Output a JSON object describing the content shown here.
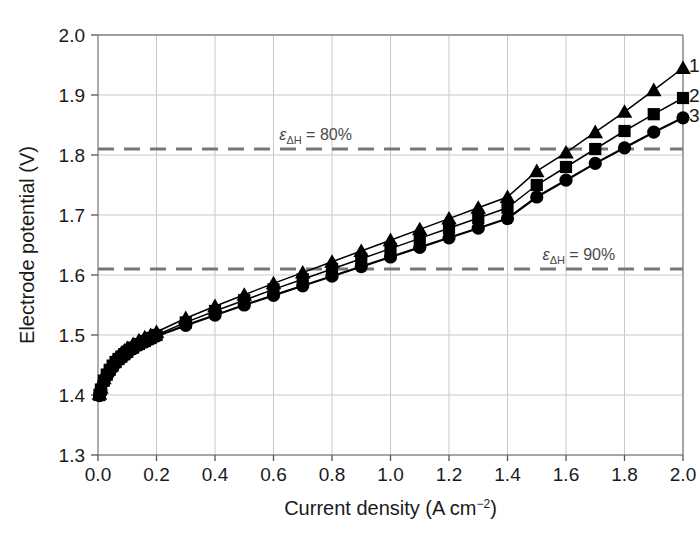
{
  "chart_data": {
    "type": "line",
    "title": "",
    "xlabel": "Current density (A cm−2)",
    "xlabel_base": "Current density (A cm",
    "xlabel_sup": "−2",
    "xlabel_tail": ")",
    "ylabel": "Electrode potential (V)",
    "xlim": [
      0.0,
      2.0
    ],
    "ylim": [
      1.3,
      2.0
    ],
    "xticks": [
      "0.0",
      "0.2",
      "0.4",
      "0.6",
      "0.8",
      "1.0",
      "1.2",
      "1.4",
      "1.6",
      "1.8",
      "2.0"
    ],
    "xtick_values": [
      0.0,
      0.2,
      0.4,
      0.6,
      0.8,
      1.0,
      1.2,
      1.4,
      1.6,
      1.8,
      2.0
    ],
    "yticks": [
      "1.3",
      "1.4",
      "1.5",
      "1.6",
      "1.7",
      "1.8",
      "1.9",
      "2.0"
    ],
    "ytick_values": [
      1.3,
      1.4,
      1.5,
      1.6,
      1.7,
      1.8,
      1.9,
      2.0
    ],
    "grid": true,
    "grid_color": "#c9c9c9",
    "legend_position": "right-inline",
    "line_color": "#000000",
    "marker_color": "#000000",
    "annotations": [
      {
        "name": "efficiency-80-line",
        "symbol": "ε",
        "subscript": "ΔH",
        "equals": " = ",
        "value": "80%",
        "text": "εΔH = 80%",
        "y": 1.81,
        "style": "dashed",
        "color": "#777777",
        "label_x": 0.62
      },
      {
        "name": "efficiency-90-line",
        "symbol": "ε",
        "subscript": "ΔH",
        "equals": " = ",
        "value": "90%",
        "text": "εΔH = 90%",
        "y": 1.61,
        "style": "dashed",
        "color": "#777777",
        "label_x": 1.52
      }
    ],
    "series": [
      {
        "name": "1",
        "label": "1",
        "marker": "triangle",
        "x": [
          0.005,
          0.01,
          0.02,
          0.03,
          0.04,
          0.05,
          0.06,
          0.07,
          0.08,
          0.09,
          0.1,
          0.12,
          0.14,
          0.16,
          0.18,
          0.2,
          0.3,
          0.4,
          0.5,
          0.6,
          0.7,
          0.8,
          0.9,
          1.0,
          1.1,
          1.2,
          1.3,
          1.4,
          1.5,
          1.6,
          1.7,
          1.8,
          1.9,
          2.0
        ],
        "values": [
          1.402,
          1.412,
          1.428,
          1.439,
          1.447,
          1.454,
          1.46,
          1.465,
          1.47,
          1.474,
          1.478,
          1.485,
          1.491,
          1.496,
          1.5,
          1.505,
          1.528,
          1.548,
          1.567,
          1.586,
          1.604,
          1.622,
          1.64,
          1.658,
          1.676,
          1.694,
          1.712,
          1.73,
          1.773,
          1.804,
          1.838,
          1.872,
          1.908,
          1.945
        ]
      },
      {
        "name": "2",
        "label": "2",
        "marker": "square",
        "x": [
          0.005,
          0.01,
          0.02,
          0.03,
          0.04,
          0.05,
          0.06,
          0.07,
          0.08,
          0.09,
          0.1,
          0.12,
          0.14,
          0.16,
          0.18,
          0.2,
          0.3,
          0.4,
          0.5,
          0.6,
          0.7,
          0.8,
          0.9,
          1.0,
          1.1,
          1.2,
          1.3,
          1.4,
          1.5,
          1.6,
          1.7,
          1.8,
          1.9,
          2.0
        ],
        "values": [
          1.4,
          1.409,
          1.424,
          1.434,
          1.442,
          1.449,
          1.455,
          1.46,
          1.464,
          1.468,
          1.472,
          1.479,
          1.485,
          1.49,
          1.495,
          1.5,
          1.521,
          1.54,
          1.558,
          1.576,
          1.593,
          1.61,
          1.627,
          1.644,
          1.661,
          1.678,
          1.695,
          1.712,
          1.75,
          1.78,
          1.81,
          1.84,
          1.868,
          1.895
        ]
      },
      {
        "name": "3",
        "label": "3",
        "marker": "circle",
        "x": [
          0.005,
          0.01,
          0.02,
          0.03,
          0.04,
          0.05,
          0.06,
          0.07,
          0.08,
          0.09,
          0.1,
          0.12,
          0.14,
          0.16,
          0.18,
          0.2,
          0.3,
          0.4,
          0.5,
          0.6,
          0.7,
          0.8,
          0.9,
          1.0,
          1.1,
          1.2,
          1.3,
          1.4,
          1.5,
          1.6,
          1.7,
          1.8,
          1.9,
          2.0
        ],
        "values": [
          1.399,
          1.408,
          1.422,
          1.432,
          1.44,
          1.447,
          1.453,
          1.458,
          1.462,
          1.466,
          1.47,
          1.477,
          1.483,
          1.488,
          1.493,
          1.498,
          1.516,
          1.533,
          1.55,
          1.566,
          1.582,
          1.598,
          1.614,
          1.63,
          1.646,
          1.662,
          1.678,
          1.694,
          1.73,
          1.758,
          1.786,
          1.812,
          1.838,
          1.862
        ]
      }
    ]
  }
}
